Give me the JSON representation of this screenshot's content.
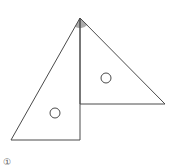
{
  "figure": {
    "colors": {
      "stroke": "#4a4a4a",
      "shade": "#9e9e9e",
      "background": "#ffffff"
    },
    "apex": [
      80,
      18
    ],
    "left_triangle": {
      "points": [
        [
          80,
          18
        ],
        [
          11,
          140
        ],
        [
          80,
          140
        ]
      ],
      "circle": {
        "cx": 55,
        "cy": 113,
        "r": 5
      }
    },
    "right_triangle": {
      "points": [
        [
          80,
          18
        ],
        [
          80,
          104
        ],
        [
          165,
          104
        ]
      ],
      "circle": {
        "cx": 106,
        "cy": 78,
        "r": 5
      }
    },
    "shaded_angle": {
      "center": [
        80,
        18
      ],
      "radius": 10
    }
  },
  "caption": {
    "label": "①"
  }
}
